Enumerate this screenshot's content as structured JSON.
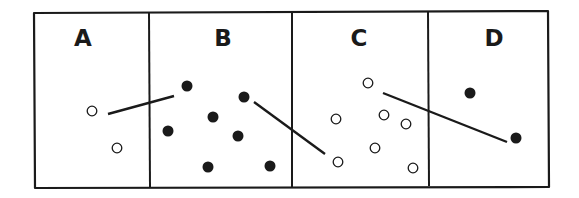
{
  "diagram": {
    "colors": {
      "stroke": "#1a1a1a",
      "filled_dot": "#1a1a1a",
      "open_dot_fill": "#ffffff",
      "background": "#ffffff"
    },
    "panels": [
      {
        "label": "A",
        "dots": [
          {
            "x": 92,
            "y": 111,
            "type": "open"
          },
          {
            "x": 117,
            "y": 148,
            "type": "open"
          }
        ]
      },
      {
        "label": "B",
        "dots": [
          {
            "x": 187,
            "y": 86,
            "type": "filled"
          },
          {
            "x": 244,
            "y": 97,
            "type": "filled"
          },
          {
            "x": 213,
            "y": 117,
            "type": "filled"
          },
          {
            "x": 168,
            "y": 131,
            "type": "filled"
          },
          {
            "x": 238,
            "y": 136,
            "type": "filled"
          },
          {
            "x": 208,
            "y": 167,
            "type": "filled"
          },
          {
            "x": 270,
            "y": 166,
            "type": "filled"
          }
        ]
      },
      {
        "label": "C",
        "dots": [
          {
            "x": 368,
            "y": 83,
            "type": "open"
          },
          {
            "x": 336,
            "y": 119,
            "type": "open"
          },
          {
            "x": 384,
            "y": 115,
            "type": "open"
          },
          {
            "x": 406,
            "y": 124,
            "type": "open"
          },
          {
            "x": 375,
            "y": 148,
            "type": "open"
          },
          {
            "x": 338,
            "y": 162,
            "type": "open"
          },
          {
            "x": 413,
            "y": 168,
            "type": "open"
          }
        ]
      },
      {
        "label": "D",
        "dots": [
          {
            "x": 470,
            "y": 93,
            "type": "filled"
          },
          {
            "x": 516,
            "y": 138,
            "type": "filled"
          }
        ]
      }
    ],
    "connector_lines": [
      {
        "x1": 108,
        "y1": 114,
        "x2": 174,
        "y2": 96
      },
      {
        "x1": 254,
        "y1": 102,
        "x2": 325,
        "y2": 154
      },
      {
        "x1": 383,
        "y1": 93,
        "x2": 507,
        "y2": 142
      }
    ]
  }
}
